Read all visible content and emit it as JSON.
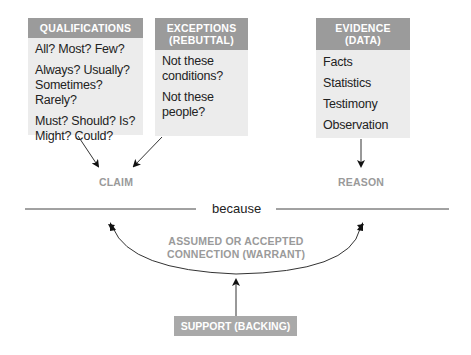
{
  "qualifications": {
    "header": "QUALIFICATIONS",
    "items": [
      "All? Most? Few?",
      "Always? Usually? Sometimes? Rarely?",
      "Must? Should? Is? Might? Could?"
    ]
  },
  "exceptions": {
    "header_line1": "EXCEPTIONS",
    "header_line2": "(REBUTTAL)",
    "items": [
      "Not these conditions?",
      "Not these people?"
    ]
  },
  "evidence": {
    "header_line1": "EVIDENCE",
    "header_line2": "(DATA)",
    "items": [
      "Facts",
      "Statistics",
      "Testimony",
      "Observation"
    ]
  },
  "claim_label": "CLAIM",
  "reason_label": "REASON",
  "because_label": "because",
  "warrant_line1": "ASSUMED OR ACCEPTED",
  "warrant_line2": "CONNECTION (WARRANT)",
  "support_label": "SUPPORT (BACKING)",
  "colors": {
    "header_bg": "#9b9b9b",
    "box_bg": "#ececec",
    "label_text": "#9a9a9a",
    "support_bg": "#a9a9a9"
  }
}
